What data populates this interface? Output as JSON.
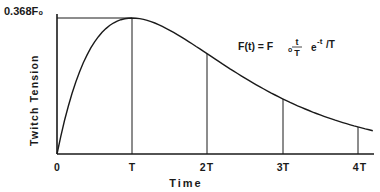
{
  "chart_data": {
    "type": "line",
    "title": "",
    "xlabel": "Time",
    "ylabel": "Twitch Tension",
    "x_ticks": [
      "0",
      "T",
      "2T",
      "3T",
      "4T"
    ],
    "x": [
      0,
      0.25,
      0.5,
      0.75,
      1,
      1.5,
      2,
      2.5,
      3,
      3.5,
      4
    ],
    "series": [
      {
        "name": "F(t)",
        "values_normalized_to_peak": [
          0,
          0.584,
          0.824,
          0.963,
          1.0,
          0.91,
          0.736,
          0.558,
          0.406,
          0.287,
          0.199
        ],
        "values_in_F0": [
          0,
          0.195,
          0.303,
          0.354,
          0.368,
          0.335,
          0.271,
          0.205,
          0.149,
          0.106,
          0.073
        ]
      }
    ],
    "y_annotation": "0.368F₀",
    "equation": "F(t) = F₀ (t/T) e^(−t/T)",
    "vertical_markers": [
      "T",
      "2T",
      "3T",
      "4T"
    ],
    "xlim": [
      0,
      4.2
    ],
    "ylim": [
      0,
      0.368
    ],
    "grid": false,
    "legend": "none"
  },
  "labels": {
    "y_peak": "0.368F₀",
    "y_axis": "Twitch Tension",
    "x_axis": "Time",
    "ticks": [
      "0",
      "T",
      "2T",
      "3T",
      "4T"
    ],
    "eq_lhs": "F(t) = F",
    "eq_sub": "o",
    "eq_num": "t",
    "eq_den": "T",
    "eq_exp_base": "e",
    "eq_exp": "-t",
    "eq_tail": "/T"
  }
}
